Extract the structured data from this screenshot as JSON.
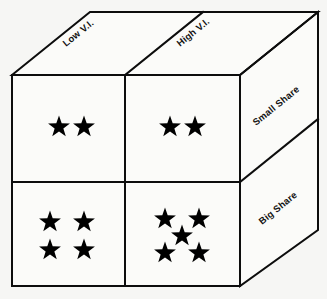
{
  "diagram": {
    "background_color": "#f6f6f4",
    "line_color": "#0d0d0d",
    "star_color": "#000000",
    "top_face_labels": [
      {
        "name": "low-vi",
        "text": "Low V.I."
      },
      {
        "name": "high-vi",
        "text": "High V.I."
      }
    ],
    "right_face_labels": [
      {
        "name": "small-share",
        "text": "Small Share"
      },
      {
        "name": "big-share",
        "text": "Big Share"
      }
    ],
    "cells": [
      {
        "name": "cell-low-vi-small-share",
        "column": "Low V.I.",
        "row": "Small Share",
        "star_count": 2,
        "pattern": "row-of-2",
        "stars": [
          {
            "cx": 59,
            "cy": 127
          },
          {
            "cx": 84,
            "cy": 127
          }
        ]
      },
      {
        "name": "cell-high-vi-small-share",
        "column": "High V.I.",
        "row": "Small Share",
        "star_count": 2,
        "pattern": "row-of-2",
        "stars": [
          {
            "cx": 170,
            "cy": 127
          },
          {
            "cx": 195,
            "cy": 127
          }
        ]
      },
      {
        "name": "cell-low-vi-big-share",
        "column": "Low V.I.",
        "row": "Big Share",
        "star_count": 4,
        "pattern": "grid-2x2",
        "stars": [
          {
            "cx": 50,
            "cy": 222
          },
          {
            "cx": 84,
            "cy": 222
          },
          {
            "cx": 50,
            "cy": 250
          },
          {
            "cx": 84,
            "cy": 250
          }
        ]
      },
      {
        "name": "cell-high-vi-big-share",
        "column": "High V.I.",
        "row": "Big Share",
        "star_count": 5,
        "pattern": "quincunx",
        "stars": [
          {
            "cx": 165,
            "cy": 219
          },
          {
            "cx": 199,
            "cy": 219
          },
          {
            "cx": 182,
            "cy": 236
          },
          {
            "cx": 165,
            "cy": 253
          },
          {
            "cx": 199,
            "cy": 253
          }
        ]
      }
    ],
    "geometry": {
      "front_face": {
        "left": 12,
        "top": 75,
        "right": 240,
        "bottom": 286
      },
      "vertical_divider_x": 125,
      "horizontal_divider_y": 182,
      "depth_offset_x": 78,
      "depth_offset_y": -63
    }
  }
}
